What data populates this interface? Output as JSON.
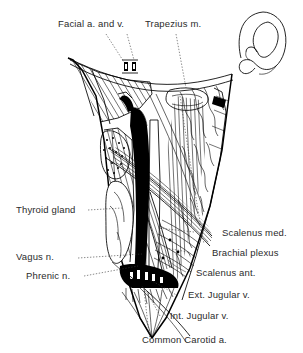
{
  "figure": {
    "style": "black and white line drawing",
    "colors": {
      "ink": "#000000",
      "background": "#ffffff",
      "label_text": "#2b2b2b"
    },
    "inset": {
      "name": "ear",
      "label": "external ear outline drawing"
    }
  },
  "labels": {
    "facial_vessels": "Facial a. and v.",
    "trapezius": "Trapezius m.",
    "thyroid_gland": "Thyroid gland",
    "vagus_nerve": "Vagus  n.",
    "phrenic_nerve": "Phrenic  n.",
    "scalenus_medius": "Scalenus med.",
    "brachial_plexus": "Brachial plexus",
    "scalenus_anterior": "Scalenus ant.",
    "external_jugular": "Ext. Jugular v.",
    "internal_jugular": "Int. Jugular v.",
    "common_carotid": "Common Carotid a."
  }
}
